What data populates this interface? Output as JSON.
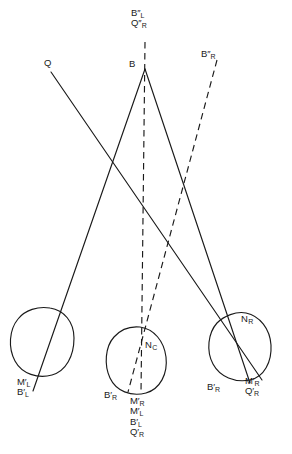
{
  "figure": {
    "type": "ray-diagram",
    "width": 292,
    "height": 454,
    "background_color": "#ffffff",
    "stroke_color": "#1a1a1a"
  },
  "labels": {
    "top_stack_line1": "B′′",
    "top_stack_line1_sub": "L",
    "top_stack_line2": "Q′′",
    "top_stack_line2_sub": "R",
    "apex": "B",
    "left_ray_origin": "Q",
    "right_dashed_origin": "B′′",
    "right_dashed_origin_sub": "R",
    "node_center": "N",
    "node_center_sub": "C",
    "node_right": "N",
    "node_right_sub": "R",
    "left_circle_line1": "M′",
    "left_circle_line1_sub": "L",
    "left_circle_line2": "B′",
    "left_circle_line2_sub": "L",
    "center_left_label": "B′",
    "center_left_label_sub": "R",
    "center_stack_1": "M′",
    "center_stack_1_sub": "R",
    "center_stack_2": "M′",
    "center_stack_2_sub": "L",
    "center_stack_3": "B′",
    "center_stack_3_sub": "L",
    "center_stack_4": "Q′",
    "center_stack_4_sub": "R",
    "right_circle_left": "B′",
    "right_circle_left_sub": "R",
    "right_stack_1": "M′",
    "right_stack_1_sub": "R",
    "right_stack_2": "Q′",
    "right_stack_2_sub": "R"
  },
  "geometry": {
    "apex": {
      "x": 145,
      "y": 69
    },
    "q_origin": {
      "x": 51,
      "y": 72
    },
    "circles": [
      {
        "name": "left-eye",
        "cx": 43,
        "cy": 341,
        "rx": 31,
        "ry": 33
      },
      {
        "name": "center-eye",
        "cx": 137,
        "cy": 360,
        "rx": 29,
        "ry": 33
      },
      {
        "name": "right-eye",
        "cx": 240,
        "cy": 346,
        "rx": 31,
        "ry": 33
      }
    ],
    "solid_rays": [
      {
        "name": "ray-B-to-left-eye",
        "from": [
          145,
          69
        ],
        "to": [
          33,
          391
        ]
      },
      {
        "name": "ray-B-to-right-eye",
        "from": [
          145,
          69
        ],
        "to": [
          250,
          383
        ]
      },
      {
        "name": "ray-Q-to-right-eye",
        "from": [
          51,
          72
        ],
        "to": [
          262,
          380
        ]
      }
    ],
    "dashed_rays": [
      {
        "name": "dashed-vertical-center",
        "from": [
          145,
          42
        ],
        "to": [
          141,
          393
        ]
      },
      {
        "name": "dashed-from-BppR",
        "from": [
          217,
          60
        ],
        "to": [
          128,
          392
        ]
      }
    ]
  }
}
